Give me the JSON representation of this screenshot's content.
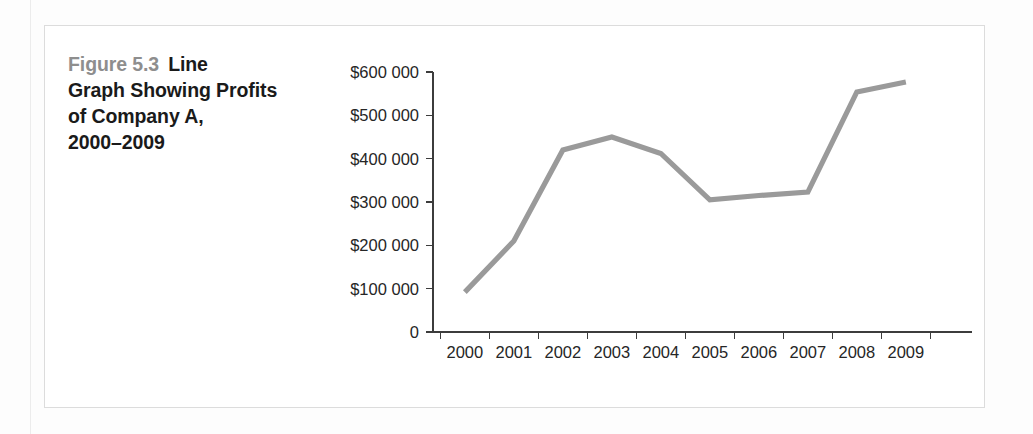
{
  "figure": {
    "number_label": "Figure 5.3",
    "caption_text": "Line Graph Showing Profits of Company A, 2000–2009",
    "caption_line_1": "Line",
    "caption_line_2": "Graph Showing Profits",
    "caption_line_3": "of Company A,",
    "caption_line_4": "2000–2009",
    "number_color": "#8e8e8e",
    "caption_color": "#1a1a1a",
    "frame_color": "#dcdcdc"
  },
  "chart_data": {
    "type": "line",
    "title": "Line Graph Showing Profits of Company A, 2000–2009",
    "xlabel": "",
    "ylabel": "",
    "categories": [
      "2000",
      "2001",
      "2002",
      "2003",
      "2004",
      "2005",
      "2006",
      "2007",
      "2008",
      "2009"
    ],
    "values": [
      92000,
      210000,
      420000,
      450000,
      412000,
      305000,
      315000,
      323000,
      554000,
      577000
    ],
    "series": [
      {
        "name": "Profits of Company A",
        "values": [
          92000,
          210000,
          420000,
          450000,
          412000,
          305000,
          315000,
          323000,
          554000,
          577000
        ],
        "color": "#9a9a9a"
      }
    ],
    "ylim": [
      0,
      600000
    ],
    "ytick_values": [
      0,
      100000,
      200000,
      300000,
      400000,
      500000,
      600000
    ],
    "ytick_labels": [
      "0",
      "$100 000",
      "$200 000",
      "$300 000",
      "$400 000",
      "$500 000",
      "$600 000"
    ],
    "xtick_labels": [
      "2000",
      "2001",
      "2002",
      "2003",
      "2004",
      "2005",
      "2006",
      "2007",
      "2008",
      "2009"
    ],
    "grid": false,
    "legend": false,
    "legend_position": "none",
    "line_color": "#9a9a9a",
    "axis_color": "#3c3c3c"
  }
}
